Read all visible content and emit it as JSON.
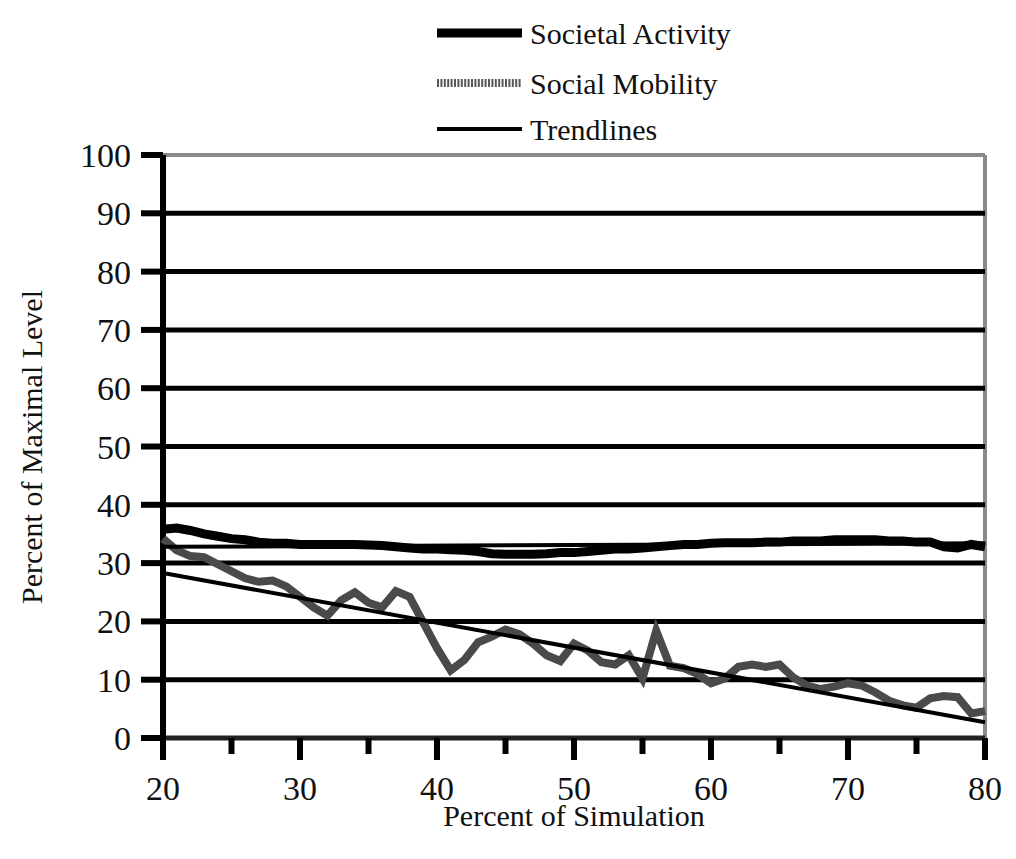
{
  "chart_data": {
    "type": "line",
    "title": "",
    "subtitle": "",
    "xlabel": "Percent of Simulation",
    "ylabel": "Percent of Maximal Level",
    "xlim": [
      20,
      80
    ],
    "ylim": [
      0,
      100
    ],
    "x_ticks": [
      20,
      30,
      40,
      50,
      60,
      70,
      80
    ],
    "x_tick_labels": [
      "20",
      "30",
      "40",
      "50",
      "60",
      "70",
      "80"
    ],
    "x_minor_tick_step": 5,
    "y_ticks": [
      0,
      10,
      20,
      30,
      40,
      50,
      60,
      70,
      80,
      90,
      100
    ],
    "y_tick_labels": [
      "0",
      "10",
      "20",
      "30",
      "40",
      "50",
      "60",
      "70",
      "80",
      "90",
      "100"
    ],
    "grid": "horizontal",
    "legend_position": "top-center",
    "legend": [
      {
        "label": "Societal Activity",
        "style": "thick-solid",
        "color": "#000000",
        "width": 9
      },
      {
        "label": "Social Mobility",
        "style": "medium-dither",
        "color": "#595959",
        "width": 8
      },
      {
        "label": "Trendlines",
        "style": "thin-solid",
        "color": "#000000",
        "width": 4
      }
    ],
    "series": [
      {
        "name": "Societal Activity",
        "color": "#000000",
        "width": 9,
        "x": [
          20,
          21,
          22,
          23,
          24,
          25,
          26,
          27,
          28,
          29,
          30,
          31,
          32,
          33,
          34,
          35,
          36,
          37,
          38,
          39,
          40,
          41,
          42,
          43,
          44,
          45,
          46,
          47,
          48,
          49,
          50,
          51,
          52,
          53,
          54,
          55,
          56,
          57,
          58,
          59,
          60,
          61,
          62,
          63,
          64,
          65,
          66,
          67,
          68,
          69,
          70,
          71,
          72,
          73,
          74,
          75,
          76,
          77,
          78,
          79,
          80
        ],
        "values": [
          35.8,
          36.0,
          35.6,
          35.0,
          34.6,
          34.2,
          34.0,
          33.6,
          33.4,
          33.4,
          33.2,
          33.2,
          33.2,
          33.2,
          33.2,
          33.1,
          33.0,
          32.8,
          32.6,
          32.4,
          32.4,
          32.3,
          32.2,
          32.0,
          31.6,
          31.5,
          31.5,
          31.5,
          31.6,
          31.8,
          31.8,
          32.0,
          32.2,
          32.4,
          32.4,
          32.6,
          32.8,
          33.0,
          33.2,
          33.2,
          33.4,
          33.5,
          33.5,
          33.5,
          33.6,
          33.6,
          33.8,
          33.8,
          33.8,
          34.0,
          34.0,
          34.0,
          34.0,
          33.8,
          33.8,
          33.6,
          33.6,
          32.8,
          32.6,
          33.2,
          32.8
        ]
      },
      {
        "name": "Social Mobility",
        "color": "#4a4a4a",
        "width": 8,
        "x": [
          20,
          21,
          22,
          23,
          24,
          25,
          26,
          27,
          28,
          29,
          30,
          31,
          32,
          33,
          34,
          35,
          36,
          37,
          38,
          39,
          40,
          41,
          42,
          43,
          44,
          45,
          46,
          47,
          48,
          49,
          50,
          51,
          52,
          53,
          54,
          55,
          56,
          57,
          58,
          59,
          60,
          61,
          62,
          63,
          64,
          65,
          66,
          67,
          68,
          69,
          70,
          71,
          72,
          73,
          74,
          75,
          76,
          77,
          78,
          79,
          80
        ],
        "values": [
          34.2,
          32.2,
          31.2,
          31.0,
          29.8,
          28.6,
          27.4,
          26.8,
          27.0,
          26.0,
          24.2,
          22.4,
          21.0,
          23.6,
          25.0,
          23.2,
          22.4,
          25.2,
          24.2,
          19.8,
          15.4,
          11.6,
          13.4,
          16.4,
          17.4,
          18.6,
          17.8,
          16.2,
          14.2,
          13.2,
          16.2,
          15.0,
          13.0,
          12.6,
          14.2,
          10.2,
          18.4,
          12.4,
          12.0,
          11.0,
          9.4,
          10.2,
          12.2,
          12.6,
          12.2,
          12.6,
          10.4,
          9.0,
          8.4,
          8.8,
          9.4,
          9.0,
          7.8,
          6.4,
          5.6,
          5.2,
          6.8,
          7.2,
          7.0,
          4.2,
          4.6
        ]
      }
    ],
    "trendlines": [
      {
        "name": "Societal Activity trendline",
        "color": "#000000",
        "width": 4,
        "x": [
          20,
          80
        ],
        "values": [
          32.8,
          33.4
        ]
      },
      {
        "name": "Social Mobility trendline",
        "color": "#000000",
        "width": 4,
        "x": [
          20,
          80
        ],
        "values": [
          28.3,
          2.7
        ]
      }
    ]
  },
  "axes": {
    "x_title": "Percent of Simulation",
    "y_title": "Percent of Maximal Level"
  }
}
